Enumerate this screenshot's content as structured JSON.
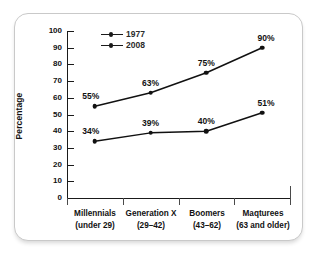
{
  "chart_data": {
    "type": "line",
    "title": "",
    "xlabel": "",
    "ylabel": "Percentage",
    "ylim": [
      0,
      100
    ],
    "yticks": [
      0,
      10,
      20,
      30,
      40,
      50,
      60,
      70,
      80,
      90,
      100
    ],
    "grid": false,
    "legend_position": "top-center",
    "categories": [
      "Millennials",
      "Generation X",
      "Boomers",
      "Maqturees"
    ],
    "category_sublabels": [
      "(under 29)",
      "(29–42)",
      "(43–62)",
      "(63 and older)"
    ],
    "series": [
      {
        "name": "1977",
        "values": [
          34,
          39,
          40,
          51
        ],
        "labels": [
          "34%",
          "39%",
          "40%",
          "51%"
        ],
        "color": "#111111",
        "marker": "circle"
      },
      {
        "name": "2008",
        "values": [
          55,
          63,
          75,
          90
        ],
        "labels": [
          "55%",
          "63%",
          "75%",
          "90%"
        ],
        "color": "#111111",
        "marker": "circle"
      }
    ]
  },
  "legend": {
    "items": [
      {
        "label": "1977"
      },
      {
        "label": "2008"
      }
    ]
  },
  "axis": {
    "y_title": "Percentage",
    "y_tick_labels": [
      "100",
      "90",
      "80",
      "70",
      "60",
      "50",
      "40",
      "30",
      "20",
      "10",
      "0"
    ]
  },
  "colors": {
    "ink": "#111111",
    "axis": "#1a1a1a",
    "frame": "#c9c9c9",
    "background": "#ffffff"
  }
}
